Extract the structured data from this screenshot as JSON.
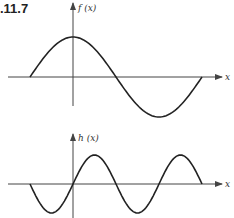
{
  "figure": {
    "label": ".11.7"
  },
  "colors": {
    "curve": "#222222",
    "axis": "#444444",
    "background": "#ffffff"
  },
  "chart_data": [
    {
      "type": "line",
      "title": "f (x)",
      "ylabel": "f (x)",
      "xlabel": "x",
      "description": "Cosine-like curve: rises from zero on the left to a maximum at the y-axis, crosses zero, reaches a minimum, returns to zero",
      "grid": false,
      "x": [
        -1,
        -0.5,
        0,
        0.5,
        1,
        1.5,
        2,
        2.5,
        3
      ],
      "values": [
        0,
        0.71,
        1,
        0.71,
        0,
        -0.71,
        -1,
        -0.71,
        0
      ]
    },
    {
      "type": "line",
      "title": "h (x)",
      "ylabel": "h (x)",
      "xlabel": "x",
      "description": "Sine-like curve with twice the frequency of f: starts at zero, dips to a minimum, passes through the origin, peaks, dips, peaks again, returns to zero",
      "grid": false,
      "x": [
        -1,
        -0.5,
        0,
        0.5,
        1,
        1.5,
        2,
        2.5,
        3
      ],
      "values": [
        0,
        -1,
        0,
        1,
        0,
        -1,
        0,
        1,
        0
      ]
    }
  ],
  "plots": {
    "top": {
      "y_label": "f (x)",
      "x_label": "x"
    },
    "bottom": {
      "y_label": "h (x)",
      "x_label": "x"
    }
  }
}
